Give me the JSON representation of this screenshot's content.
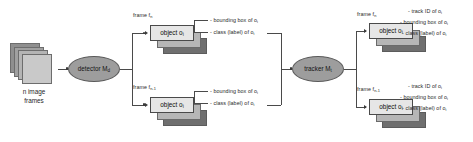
{
  "diagram": {
    "colors": {
      "ellipse_fill": "#9d9d9d",
      "object_box_fill": "#e6e6e6",
      "frame_stack_fill": "#c9c9c9",
      "line": "#4a4a4a",
      "text": "#1f1f1f"
    }
  },
  "input": {
    "label_line1": "n image",
    "label_line2": "frames",
    "stack_count": 4,
    "icon": "image-stack-icon"
  },
  "detector": {
    "label_text": "detector M",
    "label_sub": "d",
    "shape": "ellipse"
  },
  "tracker": {
    "label_text": "tracker M",
    "label_sub": "t",
    "shape": "ellipse"
  },
  "detector_outputs": [
    {
      "frame_label": "frame f",
      "frame_sub": "n",
      "object_label": "object o",
      "object_sub": "i",
      "attributes": [
        {
          "text": "- bounding box of o",
          "sub": "i"
        },
        {
          "text": "- class (label) of o",
          "sub": "i"
        }
      ]
    },
    {
      "frame_label": "frame f",
      "frame_sub": "n-1",
      "object_label": "object o",
      "object_sub": "i",
      "attributes": [
        {
          "text": "- bounding box of o",
          "sub": "i"
        },
        {
          "text": "- class (label) of o",
          "sub": "i"
        }
      ]
    }
  ],
  "tracker_outputs": [
    {
      "frame_label": "frame f",
      "frame_sub": "n",
      "object_label": "object o",
      "object_sub": "i",
      "attributes": [
        {
          "text": "- track ID of o",
          "sub": "i"
        },
        {
          "text": "- bounding box of o",
          "sub": "i"
        },
        {
          "text": "- class (label) of o",
          "sub": "i"
        }
      ]
    },
    {
      "frame_label": "frame f",
      "frame_sub": "n-1",
      "object_label": "object o",
      "object_sub": "i",
      "attributes": [
        {
          "text": "- track ID of o",
          "sub": "i"
        },
        {
          "text": "- bounding box of o",
          "sub": "i"
        },
        {
          "text": "- class (label) of o",
          "sub": "i"
        }
      ]
    }
  ]
}
